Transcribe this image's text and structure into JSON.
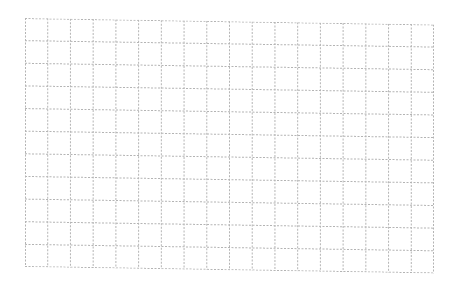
{
  "grid": {
    "columns": 18,
    "rows": 11,
    "line_color": "#b4b4b4",
    "background": "#ffffff",
    "line_style": "dashed"
  }
}
